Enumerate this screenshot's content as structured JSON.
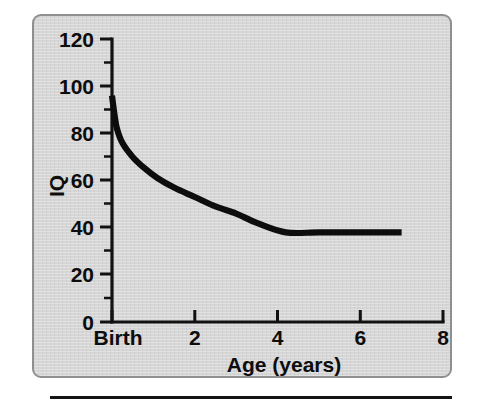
{
  "figure": {
    "panel": {
      "background_color": "#d6d6d6",
      "border_color": "#8f8f8f"
    },
    "rule_color": "#141414"
  },
  "chart_data": {
    "type": "line",
    "title": "",
    "subtitle": "",
    "xlabel": "Age (years)",
    "ylabel": "IQ",
    "xlim": [
      0,
      8
    ],
    "ylim": [
      0,
      120
    ],
    "grid": false,
    "legend": null,
    "legend_position": "none",
    "line_color": "#0d0d0d",
    "x_tick_labels": [
      "Birth",
      "2",
      "4",
      "6",
      "8"
    ],
    "x_tick_values": [
      0,
      2,
      4,
      6,
      8
    ],
    "x_minor_step": 1,
    "y_tick_labels": [
      "0",
      "20",
      "40",
      "60",
      "80",
      "100",
      "120"
    ],
    "y_tick_values": [
      0,
      20,
      40,
      60,
      80,
      100,
      120
    ],
    "y_minor_step": 10,
    "series": [
      {
        "name": "IQ",
        "x": [
          0.0,
          0.06,
          0.12,
          0.25,
          0.5,
          0.8,
          1.1,
          1.5,
          2.0,
          2.5,
          3.0,
          3.5,
          4.2,
          5.0,
          6.0,
          7.0
        ],
        "y": [
          96,
          88,
          82,
          76,
          70,
          65,
          61,
          57,
          53,
          49,
          46,
          42,
          38,
          38,
          38,
          38
        ]
      }
    ],
    "annotations": [
      "Curve begins at IQ 96 at birth",
      "Steep decline through the first year",
      "Plateau at IQ 38 from about age 4.2 to age 7"
    ]
  }
}
